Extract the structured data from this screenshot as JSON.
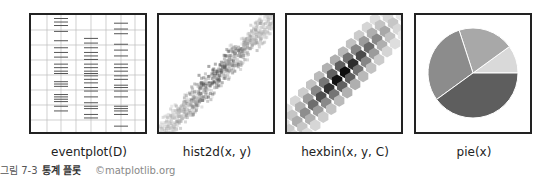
{
  "chart_data": [
    {
      "type": "eventplot",
      "label": "eventplot(D)",
      "series": [
        {
          "name": "row1",
          "x_position": 1,
          "events": [
            0.97,
            0.94,
            0.91,
            0.86,
            0.78,
            0.72,
            0.68,
            0.64,
            0.58,
            0.55,
            0.52,
            0.5,
            0.43,
            0.41,
            0.39,
            0.32,
            0.3,
            0.28,
            0.26,
            0.22,
            0.18
          ]
        },
        {
          "name": "row2",
          "x_position": 2,
          "events": [
            0.8,
            0.76,
            0.72,
            0.68,
            0.65,
            0.62,
            0.58,
            0.55,
            0.52,
            0.5,
            0.48,
            0.45,
            0.42,
            0.38,
            0.35,
            0.3,
            0.25,
            0.22,
            0.2,
            0.15,
            0.12
          ]
        },
        {
          "name": "row3",
          "x_position": 3,
          "events": [
            0.93,
            0.88,
            0.84,
            0.75,
            0.7,
            0.65,
            0.58,
            0.55,
            0.52,
            0.48,
            0.45,
            0.4,
            0.38,
            0.35,
            0.3,
            0.22,
            0.2,
            0.18,
            0.15,
            0.05
          ]
        }
      ],
      "grid": true
    },
    {
      "type": "heatmap",
      "label": "hist2d(x, y)",
      "description": "2D histogram of strongly positively correlated data, grayscale"
    },
    {
      "type": "hexbin",
      "label": "hexbin(x, y, C)",
      "description": "hexagonal binning of positively correlated data, grayscale"
    },
    {
      "type": "pie",
      "label": "pie(x)",
      "values": [
        1,
        2,
        3,
        4
      ],
      "colors": [
        "#d9d9d9",
        "#a8a8a8",
        "#8c8c8c",
        "#5e5e5e"
      ]
    }
  ],
  "labels": {
    "eventplot": "eventplot(D)",
    "hist2d": "hist2d(x, y)",
    "hexbin": "hexbin(x, y, C)",
    "pie": "pie(x)"
  },
  "caption": {
    "figure": "그림 7-3",
    "title": "통계 플롯",
    "credit": "©matplotlib.org"
  }
}
